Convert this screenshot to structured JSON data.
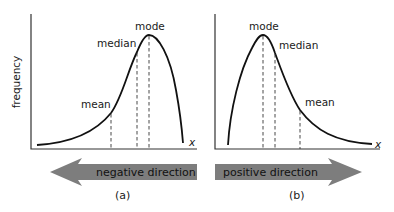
{
  "figure": {
    "y_axis_label": "frequency",
    "panels": [
      {
        "id": "a",
        "caption": "(a)",
        "skew": "negative",
        "x_axis_label": "x",
        "markers": {
          "mode": "mode",
          "median": "median",
          "mean": "mean"
        },
        "direction_arrow": {
          "label": "negative direction",
          "points": "left"
        }
      },
      {
        "id": "b",
        "caption": "(b)",
        "skew": "positive",
        "x_axis_label": "x",
        "markers": {
          "mode": "mode",
          "median": "median",
          "mean": "mean"
        },
        "direction_arrow": {
          "label": "positive direction",
          "points": "right"
        }
      }
    ],
    "colors": {
      "arrow": "#7d7d7d",
      "curve": "#111111",
      "axis": "#333333"
    }
  }
}
